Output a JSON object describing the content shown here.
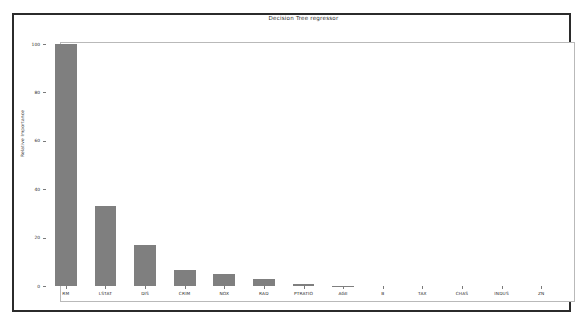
{
  "chart_data": {
    "type": "bar",
    "title": "Decision Tree regressor",
    "xlabel": "",
    "ylabel": "Relative Importance",
    "categories": [
      "RM",
      "LSTAT",
      "DIS",
      "CRIM",
      "NOX",
      "RAD",
      "PTRATIO",
      "AGE",
      "B",
      "TAX",
      "CHAS",
      "INDUS",
      "ZN"
    ],
    "values": [
      100.0,
      33.0,
      17.0,
      6.5,
      5.0,
      3.0,
      0.8,
      0.15,
      0.0,
      0.0,
      0.0,
      0.0,
      0.0
    ],
    "ylim": [
      0,
      105
    ],
    "yticks": [
      0,
      20,
      40,
      60,
      80,
      100
    ],
    "ytick_labels": [
      "0",
      "20",
      "40",
      "60",
      "80",
      "100"
    ],
    "grid": false,
    "legend": null,
    "bar_color": "#7f7f7f",
    "axes_edge_color": "#b9b9b9",
    "figure_border_color": "#2b2b2b",
    "background_color": "#ffffff"
  }
}
